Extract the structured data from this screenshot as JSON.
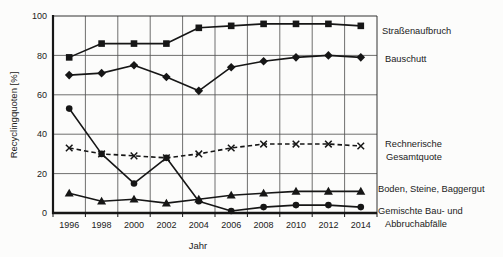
{
  "chart_data": {
    "type": "line",
    "title": "",
    "xlabel": "Jahr",
    "ylabel": "Recyclingquoten [%]",
    "x": [
      1996,
      1998,
      2000,
      2002,
      2004,
      2006,
      2008,
      2010,
      2012,
      2014
    ],
    "xtick_labels": [
      "1996",
      "1998",
      "2000",
      "2002",
      "2004",
      "2006",
      "2008",
      "2010",
      "2012",
      "2014"
    ],
    "ylim": [
      0,
      100
    ],
    "yticks": [
      0,
      20,
      40,
      60,
      80,
      100
    ],
    "grid": true,
    "legend_position": "right-annotations",
    "colors": {
      "line": "#161616",
      "grid": "#555555",
      "frame": "#333333",
      "text": "#222222",
      "background": "#fcfcfb"
    },
    "series": [
      {
        "id": "strassenaufbruch",
        "name": "Straßenaufbruch",
        "label_lines": [
          "Straßenaufbruch"
        ],
        "marker": "square",
        "line_style": "solid",
        "values": [
          79,
          86,
          86,
          86,
          94,
          95,
          96,
          96,
          96,
          95
        ]
      },
      {
        "id": "bauschutt",
        "name": "Bauschutt",
        "label_lines": [
          "Bauschutt"
        ],
        "marker": "diamond",
        "line_style": "solid",
        "values": [
          70,
          71,
          75,
          69,
          62,
          74,
          77,
          79,
          80,
          79
        ]
      },
      {
        "id": "rechnerische-gesamtquote",
        "name": "Rechnerische Gesamtquote",
        "label_lines": [
          "Rechnerische",
          "Gesamtquote"
        ],
        "marker": "x",
        "line_style": "dashed",
        "values": [
          33,
          30,
          29,
          28,
          30,
          33,
          35,
          35,
          35,
          34
        ]
      },
      {
        "id": "boden-steine-baggergut",
        "name": "Boden, Steine, Baggergut",
        "label_lines": [
          "Boden, Steine, Baggergut"
        ],
        "marker": "triangle",
        "line_style": "solid",
        "values": [
          10,
          6,
          7,
          5,
          7,
          9,
          10,
          11,
          11,
          11
        ]
      },
      {
        "id": "gemischte-bau-und-abbruchabfaelle",
        "name": "Gemischte Bau- und Abbruchabfälle",
        "label_lines": [
          "Gemischte Bau- und",
          "Abbruchabfälle"
        ],
        "marker": "circle",
        "line_style": "solid",
        "values": [
          53,
          30,
          15,
          28,
          6,
          1,
          3,
          4,
          4,
          3
        ]
      }
    ]
  }
}
